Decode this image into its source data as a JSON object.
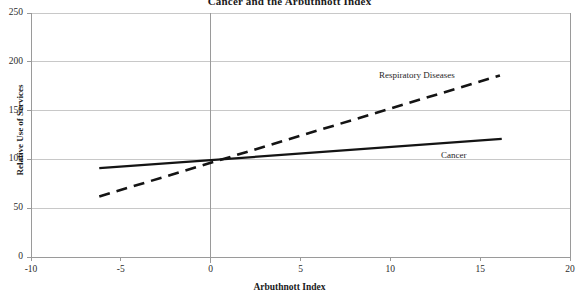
{
  "chart_data": {
    "type": "line",
    "title": "Cancer and the Arbuthnott Index",
    "xlabel": "Arbuthnott Index",
    "ylabel": "Relative Use of Services",
    "xlim": [
      -10,
      20
    ],
    "ylim": [
      0,
      250
    ],
    "xticks": [
      -10,
      -5,
      0,
      5,
      10,
      15,
      20
    ],
    "yticks": [
      0,
      50,
      100,
      150,
      200,
      250
    ],
    "xtick_labels": [
      "-10",
      "-5",
      "0",
      "5",
      "10",
      "15",
      "20"
    ],
    "ytick_labels": [
      "0",
      "50",
      "100",
      "150",
      "200",
      "250"
    ],
    "grid": "horizontal",
    "legend": "inline-annotations",
    "series": [
      {
        "name": "Respiratory Diseases",
        "style": "dashed",
        "color": "#141414",
        "x": [
          -6.2,
          16.1
        ],
        "y": [
          62,
          186
        ],
        "label_x": 3.3,
        "label_y": 196
      },
      {
        "name": "Cancer",
        "style": "solid",
        "color": "#141414",
        "x": [
          -6.2,
          16.2
        ],
        "y": [
          91,
          121
        ],
        "label_x": 13.2,
        "label_y": 110
      }
    ],
    "annotations": [
      {
        "text": "Respiratory Diseases"
      },
      {
        "text": "Cancer"
      }
    ]
  },
  "axis": {
    "y_axis_title": "Relative Use of Services",
    "x_axis_title": "Arbuthnott Index"
  },
  "colors": {
    "axis": "#9a9a9a",
    "grid": "#c8c8c8",
    "line": "#141414",
    "text": "#1a1a1a",
    "background": "#ffffff"
  }
}
